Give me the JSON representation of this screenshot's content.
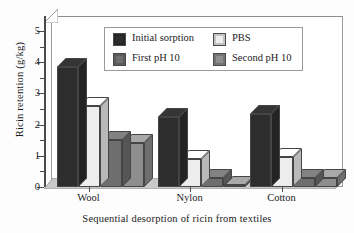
{
  "chart_data": {
    "type": "bar",
    "title": "",
    "xlabel": "Sequential desorption of ricin from textiles",
    "ylabel": "Ricin retention (g/kg)",
    "categories": [
      "Wool",
      "Nylon",
      "Cotton"
    ],
    "ylim": [
      0,
      5
    ],
    "yticks": [
      0,
      1,
      2,
      3,
      4,
      5
    ],
    "ytick_labels": [
      "0",
      "1",
      "2",
      "3",
      "4",
      "5"
    ],
    "minor_ticks": true,
    "grid": false,
    "legend_position": "upper center",
    "style": "3d-bar",
    "series": [
      {
        "name": "Initial sorption",
        "color": "#2d2d2d",
        "values": [
          3.85,
          2.25,
          2.35
        ]
      },
      {
        "name": "PBS",
        "color": "#ededed",
        "values": [
          2.6,
          0.9,
          0.95
        ]
      },
      {
        "name": "First pH 10",
        "color": "#6e6e6e",
        "values": [
          1.5,
          0.3,
          0.3
        ]
      },
      {
        "name": "Second pH 10",
        "color": "#8e8e8e",
        "values": [
          1.4,
          0.05,
          0.3
        ]
      }
    ]
  },
  "axis": {
    "y_title": "Ricin retention (g/kg)",
    "x_title": "Sequential desorption of ricin from textiles",
    "tick_0": "0",
    "tick_1": "1",
    "tick_2": "2",
    "tick_3": "3",
    "tick_4": "4",
    "tick_5": "5"
  },
  "categories": {
    "c0": "Wool",
    "c1": "Nylon",
    "c2": "Cotton"
  },
  "legend": {
    "items": [
      {
        "label": "Initial sorption",
        "color": "#2d2d2d"
      },
      {
        "label": "PBS",
        "color": "#ededed"
      },
      {
        "label": "First pH 10",
        "color": "#6e6e6e"
      },
      {
        "label": "Second pH 10",
        "color": "#8e8e8e"
      }
    ]
  }
}
